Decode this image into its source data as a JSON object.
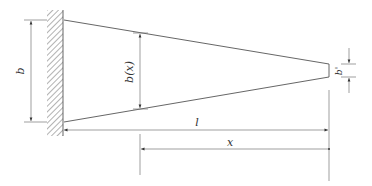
{
  "diagram": {
    "type": "tapered cantilever beam",
    "colors": {
      "line": "#555555",
      "hatch": "#666666",
      "text": "#333333",
      "background": "#ffffff"
    },
    "labels": {
      "root_width": "b",
      "local_width": "b(x)",
      "tip_width": "b'",
      "length": "l",
      "position": "x"
    },
    "support": {
      "kind": "fixed wall",
      "icon": "hatched-wall"
    }
  }
}
